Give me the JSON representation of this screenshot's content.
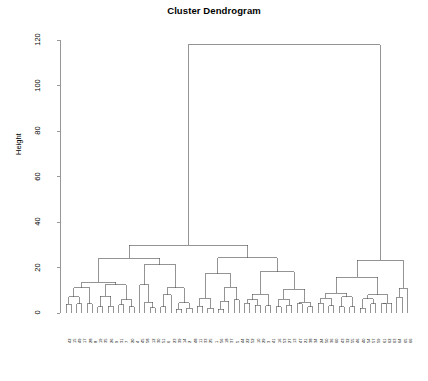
{
  "chart_data": {
    "type": "dendrogram",
    "title": "Cluster Dendrogram",
    "xlabel": "",
    "ylabel": "Height",
    "ylim": [
      0,
      120
    ],
    "yticks": [
      0,
      20,
      40,
      60,
      80,
      100,
      120
    ],
    "ytick_labels": [
      "0",
      "20",
      "40",
      "60",
      "80",
      "100",
      "120"
    ],
    "grid": false,
    "legend": "none",
    "n_leaves": 66,
    "root_height": 118,
    "leaf_labels": [
      "42",
      "15",
      "49",
      "17",
      "28",
      "8",
      "19",
      "35",
      "26",
      "9",
      "31",
      "7",
      "20",
      "4",
      "45",
      "58",
      "12",
      "30",
      "51",
      "6",
      "23",
      "39",
      "14",
      "2",
      "48",
      "11",
      "33",
      "25",
      "1",
      "56",
      "18",
      "37",
      "5",
      "44",
      "22",
      "52",
      "10",
      "29",
      "3",
      "41",
      "16",
      "53",
      "27",
      "13",
      "47",
      "21",
      "38",
      "34",
      "24",
      "50",
      "36",
      "60",
      "43",
      "32",
      "55",
      "46",
      "40",
      "54",
      "57",
      "59",
      "61",
      "62",
      "63",
      "64",
      "65",
      "66"
    ],
    "merges": [
      {
        "height": 118,
        "left_x": 222,
        "right_x": 378,
        "note": "root"
      },
      {
        "height": 28,
        "note": "left-cluster root"
      },
      {
        "height": 22,
        "note": "right-cluster root"
      },
      {
        "height": 12,
        "note": "mid sub-cluster"
      },
      {
        "height": 10,
        "note": "mid sub-cluster"
      },
      {
        "height": 7,
        "note": "low sub-cluster"
      },
      {
        "height": 5,
        "note": "low sub-cluster"
      },
      {
        "height": 3,
        "note": "leaf pair merges"
      },
      {
        "height": 2,
        "note": "leaf pair merges"
      }
    ],
    "axis": {
      "y_top_px": 40,
      "y_zero_px": 313,
      "x_axis_px": 60,
      "leaf_first_px": 66,
      "leaf_spacing_px": 5.25
    },
    "colors": {
      "line": "#4d4d4d",
      "axis": "#6b6b6b",
      "text": "#000000",
      "background": "#ffffff"
    }
  }
}
